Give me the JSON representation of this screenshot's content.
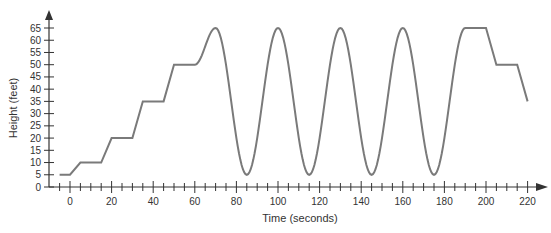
{
  "chart_data": {
    "type": "line",
    "title": "",
    "xlabel": "Time (seconds)",
    "ylabel": "Height (feet)",
    "xlim": [
      -10,
      225
    ],
    "ylim": [
      0,
      70
    ],
    "grid": false,
    "x_ticks": [
      0,
      20,
      40,
      60,
      80,
      100,
      120,
      140,
      160,
      180,
      200,
      220
    ],
    "y_ticks": [
      0,
      5,
      10,
      15,
      20,
      25,
      30,
      35,
      40,
      45,
      50,
      55,
      60,
      65
    ],
    "series": [
      {
        "name": "Height",
        "color": "#7a7a7a",
        "points": [
          [
            -5,
            5
          ],
          [
            0,
            5
          ],
          [
            5,
            10
          ],
          [
            15,
            10
          ],
          [
            20,
            20
          ],
          [
            30,
            20
          ],
          [
            35,
            35
          ],
          [
            45,
            35
          ],
          [
            50,
            50
          ],
          [
            60,
            50
          ],
          [
            70,
            65
          ],
          [
            85,
            5
          ],
          [
            100,
            65
          ],
          [
            115,
            5
          ],
          [
            130,
            65
          ],
          [
            145,
            5
          ],
          [
            160,
            65
          ],
          [
            175,
            5
          ],
          [
            190,
            65
          ],
          [
            200,
            65
          ],
          [
            205,
            50
          ],
          [
            215,
            50
          ],
          [
            220,
            35
          ]
        ]
      }
    ]
  }
}
